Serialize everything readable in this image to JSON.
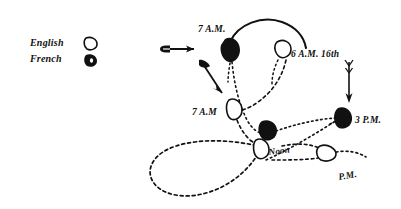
{
  "figure": {
    "background_color": "#ffffff",
    "ink_color": "#111111"
  },
  "legend": {
    "entries": [
      {
        "label": "English",
        "marker": "open-marker-icon",
        "marker_style": "outline"
      },
      {
        "label": "French",
        "marker": "filled-marker-icon",
        "marker_style": "filled"
      }
    ],
    "direction_marker": {
      "name": "wind-direction-arrow-icon",
      "description": "arrow pointing right"
    }
  },
  "annotations": [
    {
      "id": "a1",
      "text": "7 A.M.",
      "marker": "filled",
      "fleet": "French"
    },
    {
      "id": "a2",
      "text": "6 A.M. 16th",
      "marker": "open",
      "fleet": "English"
    },
    {
      "id": "a3",
      "text": "7 A.M",
      "marker": "open",
      "fleet": "English"
    },
    {
      "id": "a4",
      "text": "3 P.M.",
      "marker": "filled",
      "fleet": "French"
    },
    {
      "id": "a5",
      "text": "Noon",
      "marker": "open",
      "fleet": "English"
    },
    {
      "id": "a6",
      "text": "P.M.",
      "marker": "open",
      "fleet": "English"
    }
  ],
  "arrows": [
    {
      "id": "arrow-legend",
      "direction": "right"
    },
    {
      "id": "arrow-upper-left",
      "direction": "down-right"
    },
    {
      "id": "arrow-right",
      "direction": "down"
    }
  ]
}
